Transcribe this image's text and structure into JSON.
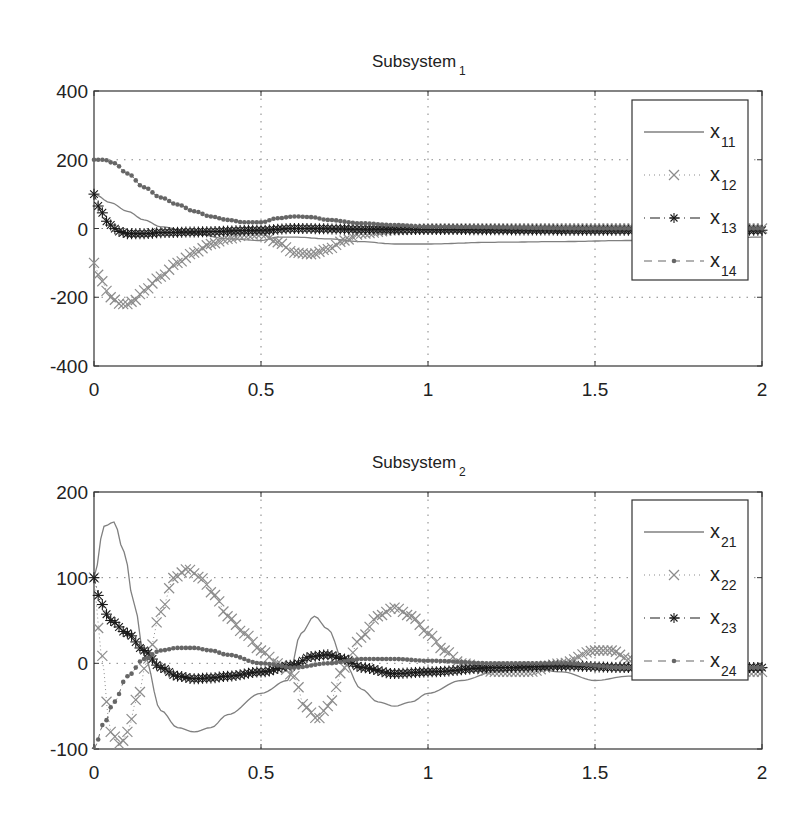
{
  "chart_data": [
    {
      "type": "line",
      "title": "Subsystem",
      "title_subscript": "1",
      "xlabel": "",
      "ylabel": "",
      "xlim": [
        0,
        2
      ],
      "ylim": [
        -400,
        400
      ],
      "xticks": [
        "0",
        "0.5",
        "1",
        "1.5",
        "2"
      ],
      "yticks": [
        "400",
        "200",
        "0",
        "-200",
        "-400"
      ],
      "grid": true,
      "legend_position": "upper right",
      "series": [
        {
          "name": "x11",
          "label": "x",
          "sub": "11",
          "style": "solid",
          "color": "#808080",
          "x": [
            0,
            0.05,
            0.1,
            0.15,
            0.2,
            0.3,
            0.4,
            0.5,
            0.55,
            0.6,
            0.7,
            0.8,
            0.9,
            1.0,
            1.2,
            1.4,
            1.6,
            1.8,
            2.0
          ],
          "y": [
            100,
            75,
            50,
            25,
            5,
            -15,
            -30,
            -35,
            -25,
            -25,
            -30,
            -38,
            -45,
            -45,
            -40,
            -38,
            -35,
            -30,
            -25
          ]
        },
        {
          "name": "x12",
          "label": "x",
          "sub": "12",
          "style": "dotted-x",
          "color": "#8c8c8c",
          "x": [
            0,
            0.02,
            0.05,
            0.08,
            0.1,
            0.12,
            0.15,
            0.2,
            0.25,
            0.3,
            0.35,
            0.4,
            0.45,
            0.5,
            0.55,
            0.6,
            0.65,
            0.7,
            0.75,
            0.8,
            0.9,
            1.0,
            1.2,
            1.5,
            2.0
          ],
          "y": [
            -100,
            -150,
            -200,
            -220,
            -220,
            -210,
            -180,
            -140,
            -100,
            -70,
            -45,
            -30,
            -20,
            -15,
            -40,
            -70,
            -75,
            -60,
            -35,
            -15,
            -5,
            0,
            0,
            0,
            0
          ]
        },
        {
          "name": "x13",
          "label": "x",
          "sub": "13",
          "style": "dashdot-star",
          "color": "#1a1a1a",
          "x": [
            0,
            0.02,
            0.04,
            0.06,
            0.08,
            0.1,
            0.15,
            0.2,
            0.3,
            0.5,
            0.6,
            0.8,
            1.0,
            1.5,
            2.0
          ],
          "y": [
            100,
            50,
            20,
            0,
            -10,
            -15,
            -15,
            -12,
            -10,
            -5,
            0,
            -2,
            -3,
            -5,
            -5
          ]
        },
        {
          "name": "x14",
          "label": "x",
          "sub": "14",
          "style": "dashed-dot",
          "color": "#666666",
          "x": [
            0,
            0.03,
            0.06,
            0.1,
            0.15,
            0.2,
            0.25,
            0.3,
            0.35,
            0.4,
            0.45,
            0.5,
            0.55,
            0.6,
            0.65,
            0.7,
            0.8,
            0.9,
            1.0,
            1.5,
            2.0
          ],
          "y": [
            200,
            200,
            190,
            160,
            120,
            90,
            70,
            50,
            35,
            25,
            18,
            18,
            30,
            35,
            33,
            25,
            15,
            10,
            5,
            0,
            0
          ]
        }
      ]
    },
    {
      "type": "line",
      "title": "Subsystem",
      "title_subscript": "2",
      "xlabel": "",
      "ylabel": "",
      "xlim": [
        0,
        2
      ],
      "ylim": [
        -100,
        200
      ],
      "xticks": [
        "0",
        "0.5",
        "1",
        "1.5",
        "2"
      ],
      "yticks": [
        "200",
        "100",
        "0",
        "-100"
      ],
      "grid": true,
      "legend_position": "upper right",
      "series": [
        {
          "name": "x21",
          "label": "x",
          "sub": "21",
          "style": "solid",
          "color": "#808080",
          "x": [
            0,
            0.03,
            0.06,
            0.09,
            0.12,
            0.15,
            0.2,
            0.25,
            0.3,
            0.35,
            0.4,
            0.5,
            0.58,
            0.62,
            0.66,
            0.7,
            0.75,
            0.8,
            0.85,
            0.9,
            0.95,
            1.0,
            1.1,
            1.2,
            1.3,
            1.4,
            1.5,
            1.6,
            1.7,
            1.8,
            1.9,
            2.0
          ],
          "y": [
            100,
            160,
            165,
            130,
            70,
            10,
            -55,
            -75,
            -80,
            -75,
            -60,
            -35,
            -20,
            35,
            55,
            40,
            0,
            -30,
            -45,
            -50,
            -45,
            -35,
            -20,
            -10,
            -5,
            -10,
            -20,
            -15,
            -10,
            -8,
            -5,
            -5
          ]
        },
        {
          "name": "x22",
          "label": "x",
          "sub": "22",
          "style": "dotted-x",
          "color": "#8c8c8c",
          "x": [
            0,
            0.02,
            0.05,
            0.08,
            0.1,
            0.13,
            0.16,
            0.2,
            0.24,
            0.28,
            0.32,
            0.36,
            0.4,
            0.45,
            0.5,
            0.55,
            0.6,
            0.63,
            0.67,
            0.7,
            0.75,
            0.8,
            0.85,
            0.9,
            0.95,
            1.0,
            1.05,
            1.1,
            1.2,
            1.3,
            1.4,
            1.5,
            1.55,
            1.6,
            1.7,
            1.8,
            1.9,
            2.0
          ],
          "y": [
            100,
            15,
            -80,
            -95,
            -80,
            -40,
            5,
            60,
            100,
            110,
            100,
            80,
            55,
            35,
            15,
            0,
            -15,
            -50,
            -65,
            -50,
            -5,
            30,
            55,
            65,
            55,
            35,
            15,
            0,
            -10,
            -10,
            0,
            15,
            15,
            5,
            -5,
            -10,
            -10,
            -10
          ]
        },
        {
          "name": "x23",
          "label": "x",
          "sub": "23",
          "style": "dashdot-star",
          "color": "#1a1a1a",
          "x": [
            0,
            0.02,
            0.05,
            0.1,
            0.15,
            0.2,
            0.25,
            0.3,
            0.35,
            0.4,
            0.5,
            0.6,
            0.65,
            0.7,
            0.75,
            0.8,
            0.9,
            1.0,
            1.2,
            1.4,
            1.6,
            1.8,
            2.0
          ],
          "y": [
            100,
            70,
            50,
            35,
            15,
            -5,
            -15,
            -18,
            -17,
            -15,
            -10,
            -2,
            8,
            10,
            5,
            -5,
            -12,
            -10,
            -5,
            -3,
            -5,
            -5,
            -5
          ]
        },
        {
          "name": "x24",
          "label": "x",
          "sub": "24",
          "style": "dashed-dot",
          "color": "#666666",
          "x": [
            0,
            0.03,
            0.06,
            0.1,
            0.15,
            0.2,
            0.25,
            0.3,
            0.35,
            0.4,
            0.5,
            0.6,
            0.7,
            0.8,
            0.9,
            1.0,
            1.2,
            1.4,
            1.6,
            1.8,
            2.0
          ],
          "y": [
            -100,
            -70,
            -45,
            -15,
            5,
            15,
            18,
            18,
            15,
            10,
            0,
            -5,
            0,
            5,
            5,
            3,
            0,
            0,
            -5,
            -5,
            -5
          ]
        }
      ]
    }
  ],
  "plots": [
    {
      "title": "Subsystem",
      "title_sub": "1",
      "legend": [
        {
          "label": "x",
          "sub": "11"
        },
        {
          "label": "x",
          "sub": "12"
        },
        {
          "label": "x",
          "sub": "13"
        },
        {
          "label": "x",
          "sub": "14"
        }
      ]
    },
    {
      "title": "Subsystem",
      "title_sub": "2",
      "legend": [
        {
          "label": "x",
          "sub": "21"
        },
        {
          "label": "x",
          "sub": "22"
        },
        {
          "label": "x",
          "sub": "23"
        },
        {
          "label": "x",
          "sub": "24"
        }
      ]
    }
  ]
}
